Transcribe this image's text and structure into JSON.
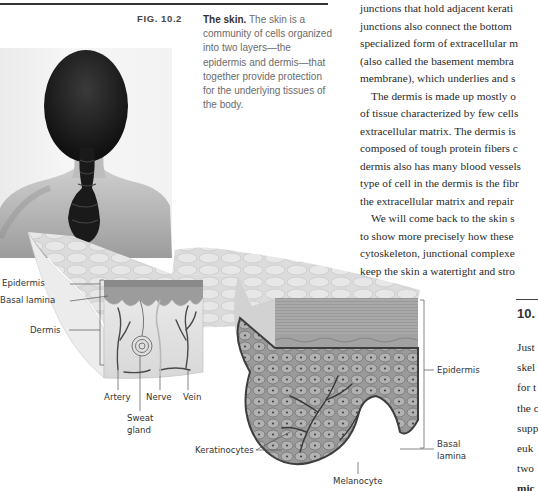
{
  "figure": {
    "label": "FIG. 10.2",
    "caption_title": "The skin.",
    "caption_text": "The skin is a community of cells organized into two layers—the epidermis and dermis—that together provide protection for the underlying tissues of the body.",
    "caption_lines": [
      "The skin is a",
      "community of cells organized",
      "into two layers—the",
      "epidermis and dermis—that",
      "together provide protection",
      "for the underlying tissues of",
      "the body."
    ],
    "photo_alt": "Back of a woman's head with braided ponytail and bare shoulders",
    "diagram_labels": {
      "epidermis_left": "Epidermis",
      "basal_lamina_left": "Basal lamina",
      "dermis": "Dermis",
      "artery": "Artery",
      "nerve": "Nerve",
      "vein": "Vein",
      "sweat_gland_1": "Sweat",
      "sweat_gland_2": "gland",
      "keratinocytes": "Keratinocytes",
      "melanocyte": "Melanocyte",
      "epidermis_right": "Epidermis",
      "basal_lamina_right_1": "Basal",
      "basal_lamina_right_2": "lamina"
    }
  },
  "body_text": {
    "lines": [
      "junctions that hold adjacent kerati",
      "junctions also connect the bottom",
      "specialized form of extracellular m",
      "(also called the basement membra",
      "membrane), which underlies and s",
      "The dermis is made up mostly o",
      "of tissue characterized by few cells",
      "extracellular matrix. The dermis is",
      "composed of tough protein fibers c",
      "dermis also has many blood vessels",
      "type of cell in the dermis is the fibr",
      "the extracellular matrix and repair",
      "We will come back to the skin s",
      "to show more precisely how these",
      "cytoskeleton, junctional complexe",
      "keep the skin a watertight and stro"
    ]
  },
  "section": {
    "number": "10.",
    "lines": [
      "Just",
      "skel",
      "for t",
      "the c",
      "supp",
      "euk",
      "two",
      "mic"
    ]
  }
}
